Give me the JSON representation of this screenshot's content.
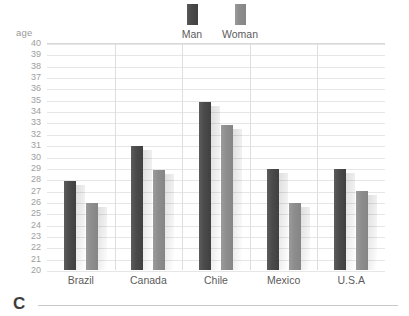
{
  "chart_data": {
    "type": "bar",
    "title": "",
    "xlabel": "",
    "ylabel": "age",
    "ylim": [
      20,
      40
    ],
    "ytick_step": 1,
    "yticks": [
      40,
      39,
      38,
      37,
      36,
      35,
      34,
      33,
      32,
      31,
      30,
      29,
      28,
      27,
      26,
      25,
      24,
      23,
      22,
      21,
      20
    ],
    "categories": [
      "Brazil",
      "Canada",
      "Chile",
      "Mexico",
      "U.S.A"
    ],
    "grid": true,
    "legend_position": "top-center",
    "series": [
      {
        "name": "Man",
        "color": "#4b4b4b",
        "values": [
          27.8,
          30.9,
          34.8,
          28.9,
          28.9
        ]
      },
      {
        "name": "Woman",
        "color": "#8e8e8e",
        "values": [
          25.9,
          28.8,
          32.8,
          25.9,
          27.0
        ]
      }
    ]
  },
  "footer": {
    "letter": "C"
  }
}
